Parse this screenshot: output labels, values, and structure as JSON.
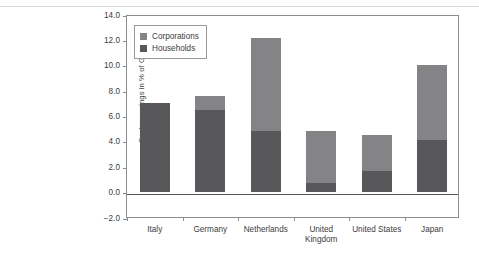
{
  "chart_data": {
    "type": "bar",
    "subtype": "stacked-bar",
    "title": "",
    "xlabel": "",
    "ylabel": "Sector savings in % of GDP",
    "categories": [
      "Italy",
      "Germany",
      "Netherlands",
      "United Kingdom",
      "United States",
      "Japan"
    ],
    "category_lines": [
      [
        "Italy"
      ],
      [
        "Germany"
      ],
      [
        "Netherlands"
      ],
      [
        "United",
        "Kingdom"
      ],
      [
        "United States"
      ],
      [
        "Japan"
      ]
    ],
    "series": [
      {
        "name": "Households",
        "color": "#58585a",
        "values": [
          7.0,
          6.4,
          4.8,
          0.7,
          1.65,
          4.1
        ]
      },
      {
        "name": "Corporations",
        "color": "#848486",
        "values": [
          0.0,
          1.1,
          7.3,
          4.1,
          2.85,
          5.9
        ]
      }
    ],
    "totals": [
      7.0,
      7.5,
      12.1,
      4.8,
      4.5,
      10.0
    ],
    "stack_order": [
      "Households",
      "Corporations"
    ],
    "ylim": [
      -2.0,
      14.0
    ],
    "ytick_values": [
      14.0,
      12.0,
      10.0,
      8.0,
      6.0,
      4.0,
      2.0,
      0.0,
      -2.0
    ],
    "ytick_labels": [
      "14.0",
      "12.0",
      "10.0",
      "8.0",
      "6.0",
      "4.0",
      "2.0",
      "0.0",
      "−2.0"
    ],
    "grid": false,
    "legend_position": "top-left",
    "legend_entries": [
      {
        "label": "Corporations",
        "color": "#848486"
      },
      {
        "label": "Households",
        "color": "#58585a"
      }
    ]
  }
}
